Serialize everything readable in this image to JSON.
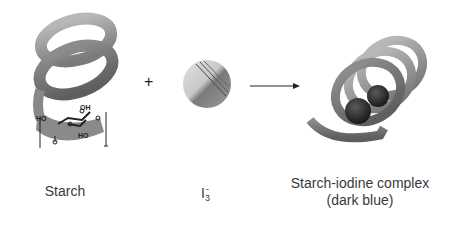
{
  "diagram": {
    "reactants": [
      {
        "id": "starch",
        "label": "Starch",
        "icon": "helix-icon"
      },
      {
        "id": "triiodide",
        "label_base": "I",
        "label_sub": "3",
        "label_sup": "-",
        "icon": "molecule-sphere-icon"
      }
    ],
    "operator": "+",
    "arrow": "reaction-arrow",
    "product": {
      "id": "starch-iodine-complex",
      "label_line1": "Starch-iodine complex",
      "label_line2": "(dark blue)",
      "icon": "helix-with-iodine-icon"
    },
    "structure_labels": {
      "oh": "OH",
      "ho_left": "HO",
      "ho_bottom": "HO",
      "o": "O"
    }
  }
}
